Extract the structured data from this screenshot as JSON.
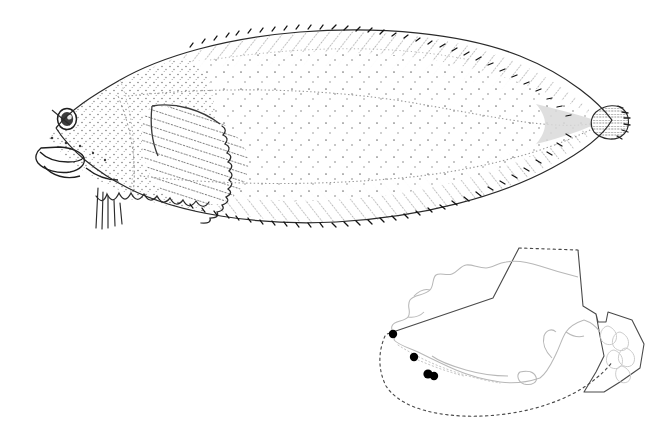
{
  "plate": {
    "background_color": "#ffffff",
    "ink_color": "#1a1a1a",
    "stipple_color": "#555555",
    "coastline_color": "#b8b8b8",
    "boundary_color": "#4a4a4a",
    "occurrence_dot_color": "#000000",
    "width": 669,
    "height": 436
  },
  "figure": {
    "type": "scientific-illustration-plate",
    "specimen_label": "",
    "panels": [
      {
        "name": "fish-illustration",
        "position": "top"
      },
      {
        "name": "distribution-map",
        "position": "bottom-right"
      }
    ]
  },
  "fish": {
    "common_name": "",
    "scientific_name": "",
    "orientation": "lateral view, head to the left",
    "body_form": "flatfish, deep oval compressed body",
    "rendering": "stipple pen-and-ink line drawing",
    "anatomy": [
      {
        "part": "head",
        "label": "head"
      },
      {
        "part": "eye",
        "label": "eye"
      },
      {
        "part": "pupil",
        "label": "pupil"
      },
      {
        "part": "mouth",
        "label": "mouth"
      },
      {
        "part": "jaw",
        "label": "lower jaw"
      },
      {
        "part": "opercle",
        "label": "opercle"
      },
      {
        "part": "pectoral-fin",
        "label": "pectoral fin"
      },
      {
        "part": "pelvic-fin",
        "label": "pelvic fin"
      },
      {
        "part": "dorsal-fin",
        "label": "dorsal fin"
      },
      {
        "part": "anal-fin",
        "label": "anal fin"
      },
      {
        "part": "caudal-fin",
        "label": "caudal fin"
      },
      {
        "part": "caudal-peduncle",
        "label": "caudal peduncle"
      },
      {
        "part": "lateral-line",
        "label": "lateral line"
      }
    ],
    "bounds": {
      "x": 38,
      "y": 28,
      "width": 566,
      "height": 196
    }
  },
  "map": {
    "region": "Alaska",
    "title": "",
    "features": {
      "coastline": "Alaska mainland, Alaska Peninsula, Aleutian Islands and Southeast Alaska panhandle drawn in light gray",
      "boundary_solid": "solid political / EEZ boundary line",
      "boundary_dotted": "dotted exclusive economic zone boundary"
    },
    "occurrence_points": [
      {
        "id": 1,
        "x": 393,
        "y": 334,
        "r": 4.2
      },
      {
        "id": 2,
        "x": 414,
        "y": 357,
        "r": 4.2
      },
      {
        "id": 3,
        "x": 428,
        "y": 374,
        "r": 4.6
      },
      {
        "id": 4,
        "x": 434,
        "y": 376,
        "r": 4.2
      }
    ],
    "occurrence_count": 4,
    "bounds": {
      "x": 372,
      "y": 243,
      "width": 272,
      "height": 165
    },
    "legend": []
  }
}
